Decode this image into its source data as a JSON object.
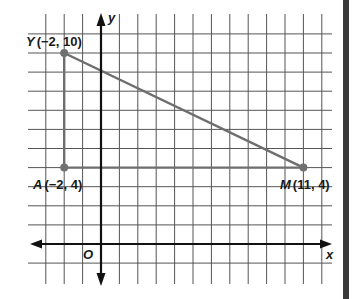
{
  "axes": {
    "x_label": "x",
    "y_label": "y",
    "origin_label": "O"
  },
  "points": [
    {
      "name": "Y",
      "x": -2,
      "y": 10,
      "label": "Y",
      "coords": "(−2, 10)"
    },
    {
      "name": "A",
      "x": -2,
      "y": 4,
      "label": "A",
      "coords": "(−2, 4)"
    },
    {
      "name": "M",
      "x": 11,
      "y": 4,
      "label": "M",
      "coords": "(11, 4)"
    }
  ],
  "segments": [
    {
      "from": "Y",
      "to": "A"
    },
    {
      "from": "A",
      "to": "M"
    },
    {
      "from": "Y",
      "to": "M"
    }
  ],
  "grid": {
    "x_min": -3,
    "x_max": 12,
    "y_min": -1,
    "y_max": 11
  },
  "colors": {
    "grid": "#555555",
    "axis": "#111111",
    "segment": "#6e6e6e",
    "point": "#707070"
  }
}
